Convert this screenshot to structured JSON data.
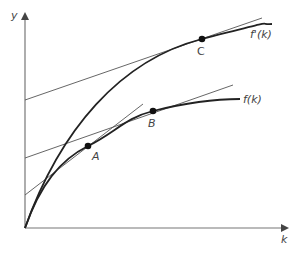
{
  "diagram": {
    "axes": {
      "y_label": "y",
      "x_label": "k",
      "origin": [
        25,
        228
      ],
      "y_axis_top": [
        25,
        14
      ],
      "x_axis_right": [
        287,
        228
      ],
      "color": "#777777"
    },
    "curves": [
      {
        "id": "upper",
        "label": "f'(k)",
        "path": "M25,228 C60,130 120,60 202,39 S255,25 272,24",
        "label_pos": [
          250,
          38
        ],
        "color": "#222222"
      },
      {
        "id": "lower",
        "label": "f(k)",
        "path": "M25,228 C40,185 60,160 88,146 S125,118 153,111 S215,99 240,99",
        "label_pos": [
          243,
          103
        ],
        "color": "#222222"
      }
    ],
    "tangents": [
      {
        "id": "tangent-c",
        "x1": 25,
        "y1": 100,
        "x2": 262,
        "y2": 18,
        "color": "#555555"
      },
      {
        "id": "tangent-b",
        "x1": 25,
        "y1": 158,
        "x2": 233,
        "y2": 85,
        "color": "#555555"
      },
      {
        "id": "tangent-a",
        "x1": 25,
        "y1": 195,
        "x2": 143,
        "y2": 104,
        "color": "#555555"
      }
    ],
    "points": [
      {
        "id": "A",
        "label": "A",
        "x": 88,
        "y": 146,
        "label_pos": [
          92,
          160
        ]
      },
      {
        "id": "B",
        "label": "B",
        "x": 153,
        "y": 111,
        "label_pos": [
          148,
          127
        ]
      },
      {
        "id": "C",
        "label": "C",
        "x": 202,
        "y": 39,
        "label_pos": [
          197,
          55
        ]
      }
    ]
  }
}
